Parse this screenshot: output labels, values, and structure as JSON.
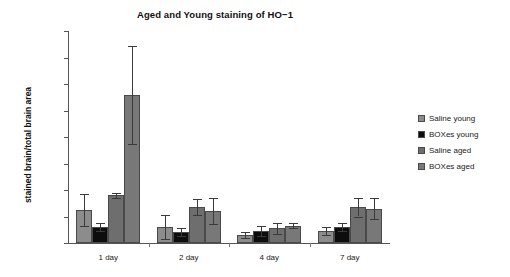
{
  "chart_data": {
    "type": "bar",
    "title": "Aged and Young staining of HO−1",
    "xlabel": "",
    "ylabel": "stained brain/total brain area",
    "categories": [
      "1 day",
      "2 day",
      "4 day",
      "7 day"
    ],
    "ylim": [
      0,
      0.016
    ],
    "ytick_labels": [
      "0",
      "0.002",
      "0.004",
      "0.006",
      "0.008",
      "0.01",
      "0.012",
      "0.014",
      "0.016"
    ],
    "ytick_values": [
      0,
      0.002,
      0.004,
      0.006,
      0.008,
      0.01,
      0.012,
      0.014,
      0.016
    ],
    "grid": false,
    "legend_position": "right",
    "series": [
      {
        "name": "Saline young",
        "color": "#8c8c8c",
        "values": [
          0.0025,
          0.0012,
          0.0006,
          0.0009
        ],
        "errors": [
          0.0012,
          0.0009,
          0.0002,
          0.0003
        ]
      },
      {
        "name": "BOXes young",
        "color": "#0d0d0d",
        "values": [
          0.0012,
          0.0008,
          0.0009,
          0.0012
        ],
        "errors": [
          0.0003,
          0.0003,
          0.0004,
          0.0003
        ]
      },
      {
        "name": "Saline aged",
        "color": "#6e6e6e",
        "values": [
          0.0036,
          0.0027,
          0.0011,
          0.0027
        ],
        "errors": [
          0.0002,
          0.0006,
          0.0004,
          0.0007
        ]
      },
      {
        "name": "BOXes aged",
        "color": "#787878",
        "values": [
          0.0112,
          0.0024,
          0.0013,
          0.0026
        ],
        "errors": [
          0.0037,
          0.001,
          0.0002,
          0.0008
        ]
      }
    ]
  }
}
